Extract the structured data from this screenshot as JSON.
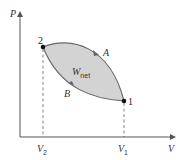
{
  "diagram": {
    "axes": {
      "y_label": "P",
      "x_label": "V"
    },
    "points": [
      {
        "id": "2",
        "label": "2",
        "x": 43,
        "y": 47
      },
      {
        "id": "1",
        "label": "1",
        "x": 124,
        "y": 101
      }
    ],
    "paths": [
      {
        "id": "A",
        "label": "A",
        "from": "2",
        "to": "1",
        "direction": "upper curve"
      },
      {
        "id": "B",
        "label": "B",
        "from": "1",
        "to": "2",
        "direction": "lower curve"
      }
    ],
    "region": {
      "label_main": "W",
      "label_sub": "net",
      "fill": "#d3d3d3"
    },
    "ticks": [
      {
        "label_main": "V",
        "label_sub": "2",
        "x": 43
      },
      {
        "label_main": "V",
        "label_sub": "1",
        "x": 124
      }
    ],
    "colors": {
      "curve": "#666666",
      "axis": "#555555",
      "fill": "#d3d3d3",
      "point": "#111111"
    }
  }
}
